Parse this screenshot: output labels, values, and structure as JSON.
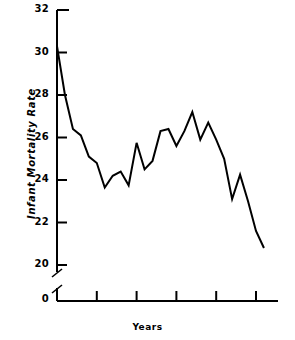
{
  "chart_data": {
    "type": "line",
    "title": "",
    "xlabel": "Years",
    "ylabel": "Infant Mortality Rate",
    "xlim": [
      1944.4,
      1971.6
    ],
    "ylim": [
      19.4,
      32.0
    ],
    "grid": false,
    "legend": null,
    "axis_break": {
      "axis": "y",
      "between": [
        0,
        19.4
      ],
      "zero_label": "0"
    },
    "yticks": [
      20,
      22,
      24,
      26,
      28,
      30,
      32
    ],
    "ytick_labels": [
      "20",
      "22",
      "24",
      "26",
      "28",
      "30",
      "32"
    ],
    "xticks": [
      1945,
      1950,
      1955,
      1960,
      1965,
      1970
    ],
    "xtick_labels": [
      "1945",
      "1950",
      "1955",
      "1960",
      "1965",
      "1970"
    ],
    "line_color": "#000000",
    "line_width": 2.0,
    "x": [
      1945,
      1946,
      1947,
      1948,
      1949,
      1950,
      1951,
      1952,
      1953,
      1954,
      1955,
      1956,
      1957,
      1958,
      1959,
      1960,
      1961,
      1962,
      1963,
      1964,
      1965,
      1966,
      1967,
      1968,
      1969,
      1970,
      1971
    ],
    "values": [
      30.3,
      28.0,
      26.4,
      26.1,
      25.1,
      24.8,
      23.65,
      24.2,
      24.4,
      23.75,
      25.75,
      24.5,
      24.9,
      26.3,
      26.4,
      25.6,
      26.3,
      27.2,
      25.9,
      26.7,
      25.9,
      25.0,
      23.1,
      24.25,
      23.0,
      21.6,
      20.8
    ],
    "series": [
      {
        "name": "Infant Mortality Rate",
        "values": [
          30.3,
          28.0,
          26.4,
          26.1,
          25.1,
          24.8,
          23.65,
          24.2,
          24.4,
          23.75,
          25.75,
          24.5,
          24.9,
          26.3,
          26.4,
          25.6,
          26.3,
          27.2,
          25.9,
          26.7,
          25.9,
          25.0,
          23.1,
          24.25,
          23.0,
          21.6,
          20.8
        ]
      }
    ]
  }
}
